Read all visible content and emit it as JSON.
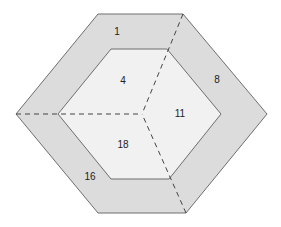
{
  "diagram": {
    "type": "nested-hexagon-regions",
    "colors": {
      "background": "#ffffff",
      "outer_ring": "#dcdcdc",
      "inner_hexagon": "#f1f1f1",
      "edge": "#6e6e6e",
      "dashed": "#444444",
      "label": "#222222"
    },
    "outer_hexagon": [
      [
        98,
        14
      ],
      [
        183,
        14
      ],
      [
        267,
        114
      ],
      [
        186,
        213
      ],
      [
        98,
        213
      ],
      [
        16,
        114
      ]
    ],
    "inner_hexagon": [
      [
        111,
        49
      ],
      [
        167,
        49
      ],
      [
        221,
        114
      ],
      [
        169,
        179
      ],
      [
        111,
        179
      ],
      [
        58,
        114
      ]
    ],
    "center": [
      142,
      114
    ],
    "dashed_lines": [
      [
        [
          16,
          114
        ],
        [
          142,
          114
        ]
      ],
      [
        [
          183,
          14
        ],
        [
          142,
          114
        ]
      ],
      [
        [
          186,
          213
        ],
        [
          142,
          114
        ]
      ]
    ],
    "regions": [
      {
        "id": "r1",
        "label": "1",
        "x": 117,
        "y": 35,
        "ring": "outer"
      },
      {
        "id": "r8",
        "label": "8",
        "x": 217,
        "y": 83,
        "ring": "outer"
      },
      {
        "id": "r16",
        "label": "16",
        "x": 90,
        "y": 180,
        "ring": "outer"
      },
      {
        "id": "r4",
        "label": "4",
        "x": 123,
        "y": 84,
        "ring": "inner"
      },
      {
        "id": "r11",
        "label": "11",
        "x": 180,
        "y": 117,
        "ring": "inner"
      },
      {
        "id": "r18",
        "label": "18",
        "x": 123,
        "y": 148,
        "ring": "inner"
      }
    ]
  }
}
